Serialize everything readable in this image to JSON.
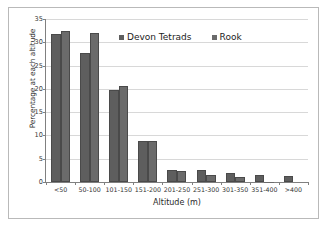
{
  "chart_data": {
    "type": "bar",
    "title": "",
    "xlabel": "Altitude (m)",
    "ylabel": "Percentage at each altitude",
    "categories": [
      "<50",
      "50-100",
      "101-150",
      "151-200",
      "201-250",
      "251-300",
      "301-350",
      "351-400",
      ">400"
    ],
    "series": [
      {
        "name": "Devon Tetrads",
        "color": "#5e5e5e",
        "values": [
          31.8,
          27.6,
          19.8,
          8.9,
          2.5,
          2.6,
          2.0,
          1.5,
          1.2
        ]
      },
      {
        "name": "Rook",
        "color": "#6b6b6b",
        "values": [
          32.4,
          32.1,
          20.6,
          8.7,
          2.4,
          1.5,
          1.0,
          0.1,
          0.0
        ]
      }
    ],
    "ylim": [
      0,
      35
    ],
    "yticks": [
      0,
      5,
      10,
      15,
      20,
      25,
      30,
      35
    ],
    "ytick_labels": [
      "0",
      "5",
      "10",
      "15",
      "20",
      "25",
      "30",
      "35"
    ],
    "grid": "horizontal",
    "legend_position": "top-center",
    "background_color": "#ffffff",
    "gridline_color": "#d8d8d8",
    "axis_color": "#808080",
    "frame_color": "#b9b9b9"
  }
}
